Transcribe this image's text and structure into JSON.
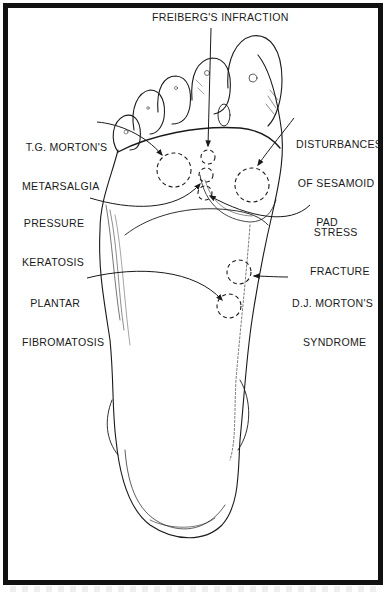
{
  "figure": {
    "colors": {
      "ink": "#1a1a1a",
      "frame": "#111111",
      "background": "#ffffff"
    }
  },
  "labels": {
    "freibergs": "FREIBERG'S INFRACTION",
    "tg_morton": [
      "T.G. MORTON'S",
      "METARSALGIA"
    ],
    "sesamoid": [
      "DISTURBANCES",
      "OF SESAMOID",
      "PAD"
    ],
    "pressure_keratosis": [
      "PRESSURE",
      "KERATOSIS"
    ],
    "stress_fracture": [
      "STRESS",
      "FRACTURE"
    ],
    "plantar_fibromatosis": [
      "PLANTAR",
      "FIBROMATOSIS"
    ],
    "dj_morton": [
      "D.J. MORTON'S",
      "SYNDROME"
    ]
  },
  "diagram": {
    "nodes": [
      {
        "id": "freibergs",
        "label": "Freiberg's Infraction",
        "target": "second metatarsal head"
      },
      {
        "id": "tg_morton",
        "label": "T.G. Morton's Metarsalgia",
        "target": "lateral forefoot circle"
      },
      {
        "id": "sesamoid",
        "label": "Disturbances of Sesamoid Pad",
        "target": "first metatarsal head"
      },
      {
        "id": "pressure_keratosis",
        "label": "Pressure Keratosis",
        "target": "metatarsal head circle"
      },
      {
        "id": "stress_fracture",
        "label": "Stress Fracture",
        "target": "metatarsal shaft circle"
      },
      {
        "id": "plantar_fibromatosis",
        "label": "Plantar Fibromatosis",
        "target": "midfoot circle"
      },
      {
        "id": "dj_morton",
        "label": "D.J. Morton's Syndrome",
        "target": "medial midfoot"
      }
    ],
    "marker_style": "dashed circle"
  }
}
